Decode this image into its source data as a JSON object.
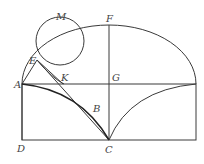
{
  "diagram": {
    "type": "geometric-construction",
    "points": {
      "A": {
        "label": "A",
        "x": 22,
        "y": 84
      },
      "B": {
        "label": "B",
        "x": 92,
        "y": 113
      },
      "C": {
        "label": "C",
        "x": 109,
        "y": 140
      },
      "D": {
        "label": "D",
        "x": 22,
        "y": 140
      },
      "E": {
        "label": "E",
        "x": 37,
        "y": 60
      },
      "F": {
        "label": "F",
        "x": 109,
        "y": 25
      },
      "G": {
        "label": "G",
        "x": 109,
        "y": 84
      },
      "K": {
        "label": "K",
        "x": 63,
        "y": 84
      },
      "M": {
        "label": "M",
        "x": 60,
        "y": 18
      }
    },
    "labels": [
      "M",
      "F",
      "E",
      "K",
      "G",
      "A",
      "B",
      "D",
      "C"
    ]
  }
}
